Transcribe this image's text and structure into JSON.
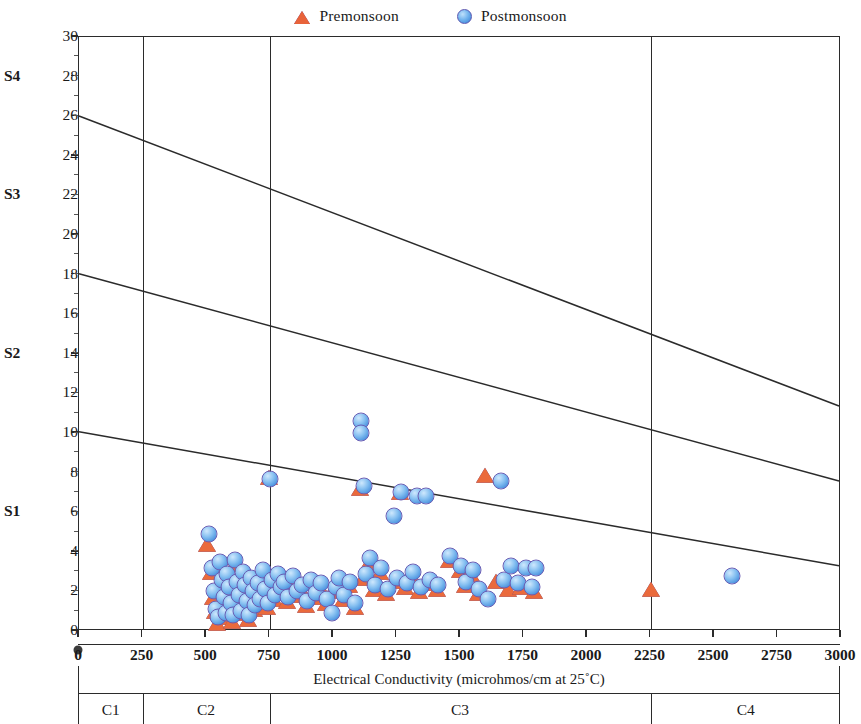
{
  "legend": {
    "items": [
      {
        "label": "Premonsoon",
        "marker": "triangle-icon",
        "color": "#ea6a3c"
      },
      {
        "label": "Postmonsoon",
        "marker": "circle-icon",
        "color": "#4f96e0"
      }
    ]
  },
  "axes": {
    "x_title": "Electrical Conductivity (microhmos/cm at 25˚C)",
    "y_title": "Sodium Absorption Ratio (SAR)",
    "x_ticks": [
      0,
      250,
      500,
      750,
      1000,
      1250,
      1500,
      1750,
      2000,
      2250,
      2500,
      2750,
      3000
    ],
    "x_tick_labels": [
      "0",
      "250",
      "500",
      "750",
      "1000",
      "1250",
      "1500",
      "1750",
      "2000",
      "2250",
      "2500",
      "2750",
      "3000"
    ],
    "y_ticks": [
      0,
      2,
      4,
      6,
      8,
      10,
      12,
      14,
      16,
      18,
      20,
      22,
      24,
      26,
      28,
      30
    ],
    "y_tick_labels": [
      "0",
      "2",
      "4",
      "6",
      "8",
      "10",
      "12",
      "14",
      "16",
      "18",
      "20",
      "22",
      "24",
      "26",
      "28",
      "30"
    ],
    "xlim": [
      0,
      3000
    ],
    "ylim": [
      0,
      30
    ]
  },
  "sodium_classes": [
    {
      "label": "S1",
      "at": 6
    },
    {
      "label": "S2",
      "at": 14
    },
    {
      "label": "S3",
      "at": 22
    },
    {
      "label": "S4",
      "at": 28
    }
  ],
  "salinity_classes": [
    {
      "label": "C1",
      "center": 125
    },
    {
      "label": "C2",
      "center": 500
    },
    {
      "label": "C3",
      "center": 1500
    },
    {
      "label": "C4",
      "center": 2625
    }
  ],
  "salinity_dividers": [
    250,
    750,
    2250
  ],
  "boundary_lines": [
    {
      "name": "S3-S4",
      "x0": 0,
      "y0": 26,
      "x1": 3000,
      "y1": 11.3
    },
    {
      "name": "S2-S3",
      "x0": 0,
      "y0": 18,
      "x1": 3000,
      "y1": 7.5
    },
    {
      "name": "S1-S2",
      "x0": 0,
      "y0": 10,
      "x1": 3000,
      "y1": 3.2
    }
  ],
  "chart_data": {
    "type": "scatter",
    "title": "",
    "xlabel": "Electrical Conductivity (microhmos/cm at 25˚C)",
    "ylabel": "Sodium Absorption Ratio (SAR)",
    "xlim": [
      0,
      3000
    ],
    "ylim": [
      0,
      30
    ],
    "grid": false,
    "legend_position": "top-center",
    "annotations": {
      "sodium_hazard_classes": [
        "S1",
        "S2",
        "S3",
        "S4"
      ],
      "salinity_hazard_classes": [
        "C1",
        "C2",
        "C3",
        "C4"
      ],
      "class_boundaries_x": [
        250,
        750,
        2250
      ],
      "diagram": "US Salinity Laboratory classification"
    },
    "series": [
      {
        "name": "Premonsoon",
        "marker": "triangle",
        "color": "#ea6a3c",
        "points": [
          [
            505,
            4.3
          ],
          [
            520,
            2.9
          ],
          [
            528,
            1.6
          ],
          [
            535,
            0.9
          ],
          [
            545,
            0.3
          ],
          [
            552,
            3.1
          ],
          [
            560,
            2.3
          ],
          [
            566,
            1.4
          ],
          [
            575,
            0.6
          ],
          [
            580,
            2.6
          ],
          [
            588,
            1.9
          ],
          [
            596,
            1.1
          ],
          [
            604,
            0.4
          ],
          [
            610,
            3.3
          ],
          [
            618,
            2.2
          ],
          [
            625,
            1.5
          ],
          [
            632,
            0.8
          ],
          [
            640,
            2.7
          ],
          [
            648,
            2.0
          ],
          [
            656,
            1.2
          ],
          [
            664,
            0.5
          ],
          [
            672,
            2.4
          ],
          [
            680,
            1.7
          ],
          [
            690,
            1.0
          ],
          [
            700,
            2.1
          ],
          [
            710,
            1.3
          ],
          [
            720,
            2.8
          ],
          [
            730,
            1.8
          ],
          [
            742,
            1.1
          ],
          [
            748,
            7.7
          ],
          [
            756,
            2.3
          ],
          [
            768,
            1.5
          ],
          [
            780,
            2.6
          ],
          [
            792,
            1.9
          ],
          [
            805,
            2.2
          ],
          [
            820,
            1.4
          ],
          [
            838,
            2.5
          ],
          [
            856,
            1.7
          ],
          [
            875,
            2.0
          ],
          [
            892,
            1.2
          ],
          [
            910,
            2.3
          ],
          [
            930,
            1.6
          ],
          [
            950,
            2.1
          ],
          [
            972,
            1.3
          ],
          [
            995,
            1.9
          ],
          [
            1018,
            2.4
          ],
          [
            1040,
            1.5
          ],
          [
            1062,
            2.2
          ],
          [
            1085,
            1.1
          ],
          [
            1105,
            7.1
          ],
          [
            1120,
            2.6
          ],
          [
            1140,
            3.4
          ],
          [
            1160,
            2.0
          ],
          [
            1185,
            2.9
          ],
          [
            1210,
            1.8
          ],
          [
            1235,
            2.4
          ],
          [
            1262,
            6.9
          ],
          [
            1285,
            2.1
          ],
          [
            1310,
            2.7
          ],
          [
            1340,
            1.9
          ],
          [
            1375,
            2.3
          ],
          [
            1410,
            2.0
          ],
          [
            1455,
            3.5
          ],
          [
            1500,
            3.0
          ],
          [
            1520,
            2.2
          ],
          [
            1545,
            2.8
          ],
          [
            1570,
            1.8
          ],
          [
            1600,
            7.8
          ],
          [
            1640,
            2.4
          ],
          [
            1690,
            2.0
          ],
          [
            1740,
            2.1
          ],
          [
            1790,
            1.9
          ],
          [
            2250,
            2.0
          ]
        ]
      },
      {
        "name": "Postmonsoon",
        "marker": "circle",
        "color": "#4f96e0",
        "points": [
          [
            512,
            4.9
          ],
          [
            522,
            3.2
          ],
          [
            530,
            2.0
          ],
          [
            538,
            1.1
          ],
          [
            548,
            0.7
          ],
          [
            556,
            3.5
          ],
          [
            563,
            2.6
          ],
          [
            570,
            1.7
          ],
          [
            578,
            0.9
          ],
          [
            584,
            2.9
          ],
          [
            592,
            2.2
          ],
          [
            600,
            1.4
          ],
          [
            608,
            0.8
          ],
          [
            614,
            3.6
          ],
          [
            622,
            2.5
          ],
          [
            630,
            1.8
          ],
          [
            638,
            1.0
          ],
          [
            645,
            3.0
          ],
          [
            652,
            2.3
          ],
          [
            660,
            1.5
          ],
          [
            668,
            0.8
          ],
          [
            676,
            2.7
          ],
          [
            684,
            2.0
          ],
          [
            694,
            1.3
          ],
          [
            704,
            2.4
          ],
          [
            714,
            1.6
          ],
          [
            724,
            3.1
          ],
          [
            734,
            2.1
          ],
          [
            745,
            1.4
          ],
          [
            750,
            7.7
          ],
          [
            760,
            2.6
          ],
          [
            772,
            1.8
          ],
          [
            784,
            2.9
          ],
          [
            796,
            2.2
          ],
          [
            808,
            2.5
          ],
          [
            824,
            1.7
          ],
          [
            842,
            2.8
          ],
          [
            860,
            2.0
          ],
          [
            878,
            2.3
          ],
          [
            896,
            1.5
          ],
          [
            914,
            2.6
          ],
          [
            934,
            1.9
          ],
          [
            954,
            2.4
          ],
          [
            976,
            1.6
          ],
          [
            998,
            0.9
          ],
          [
            1012,
            2.2
          ],
          [
            1022,
            2.7
          ],
          [
            1044,
            1.8
          ],
          [
            1066,
            2.5
          ],
          [
            1088,
            1.4
          ],
          [
            1110,
            10.6
          ],
          [
            1112,
            10.0
          ],
          [
            1124,
            7.3
          ],
          [
            1130,
            2.9
          ],
          [
            1145,
            3.7
          ],
          [
            1165,
            2.3
          ],
          [
            1190,
            3.2
          ],
          [
            1215,
            2.1
          ],
          [
            1240,
            5.8
          ],
          [
            1250,
            2.7
          ],
          [
            1268,
            7.0
          ],
          [
            1290,
            2.4
          ],
          [
            1315,
            3.0
          ],
          [
            1330,
            6.8
          ],
          [
            1345,
            2.2
          ],
          [
            1365,
            6.8
          ],
          [
            1380,
            2.6
          ],
          [
            1415,
            2.3
          ],
          [
            1460,
            3.8
          ],
          [
            1505,
            3.3
          ],
          [
            1525,
            2.5
          ],
          [
            1550,
            3.1
          ],
          [
            1575,
            2.1
          ],
          [
            1610,
            1.6
          ],
          [
            1660,
            7.6
          ],
          [
            1672,
            2.6
          ],
          [
            1700,
            3.3
          ],
          [
            1730,
            2.4
          ],
          [
            1760,
            3.2
          ],
          [
            1785,
            2.2
          ],
          [
            1800,
            3.2
          ],
          [
            2570,
            2.8
          ]
        ]
      }
    ]
  }
}
